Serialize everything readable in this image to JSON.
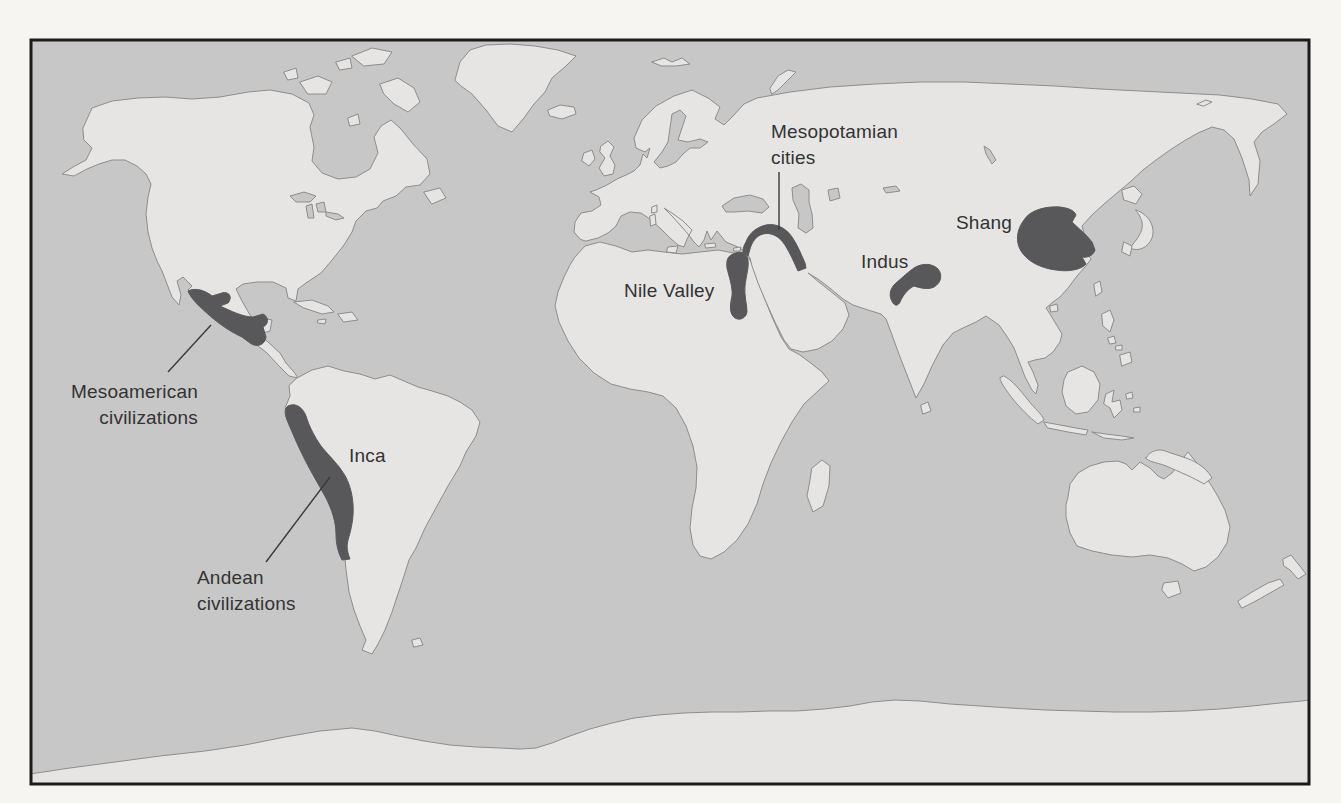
{
  "map": {
    "labels": {
      "mesopotamian_cities": "Mesopotamian\ncities",
      "nile_valley": "Nile Valley",
      "indus": "Indus",
      "shang": "Shang",
      "mesoamerican": "Mesoamerican\ncivilizations",
      "inca": "Inca",
      "andean": "Andean\ncivilizations"
    },
    "colors": {
      "ocean": "#c7c7c7",
      "land": "#e6e5e3",
      "coastline": "#8d8d8d",
      "highlight": "#58585a",
      "frame_border": "#1b1b1b",
      "label_text": "#333333",
      "page_background": "#f6f5f2"
    }
  }
}
